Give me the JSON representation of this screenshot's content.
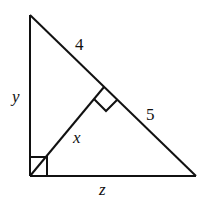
{
  "diagram": {
    "type": "right-triangle-with-altitude",
    "labels": {
      "hyp_upper": "4",
      "hyp_lower": "5",
      "left_leg": "y",
      "altitude": "x",
      "bottom_leg": "z"
    },
    "colors": {
      "stroke": "#111111",
      "background": "#ffffff"
    }
  }
}
